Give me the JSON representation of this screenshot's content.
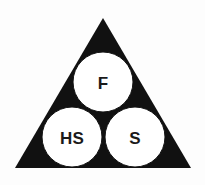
{
  "diagram": {
    "type": "venn-triangle",
    "colors": {
      "background": "#fdfdfd",
      "triangle_fill": "#111111",
      "circle_fill": "#ffffff",
      "circle_stroke": "#111111",
      "label_color": "#1a1a1a"
    },
    "triangle": {
      "name": "outer-triangle",
      "apex": {
        "x": 103,
        "y": 18
      },
      "bottom_left": {
        "x": 15,
        "y": 168
      },
      "bottom_right": {
        "x": 191,
        "y": 168
      },
      "points": "103,18 191,168 15,168"
    },
    "circles": [
      {
        "id": "circle-f",
        "label": "F",
        "position": "top",
        "cx": 103,
        "cy": 82,
        "r": 30,
        "font_size": 17
      },
      {
        "id": "circle-hs",
        "label": "HS",
        "position": "bottom-left",
        "cx": 72,
        "cy": 137,
        "r": 30,
        "font_size": 17
      },
      {
        "id": "circle-s",
        "label": "S",
        "position": "bottom-right",
        "cx": 135,
        "cy": 137,
        "r": 30,
        "font_size": 17
      }
    ]
  }
}
